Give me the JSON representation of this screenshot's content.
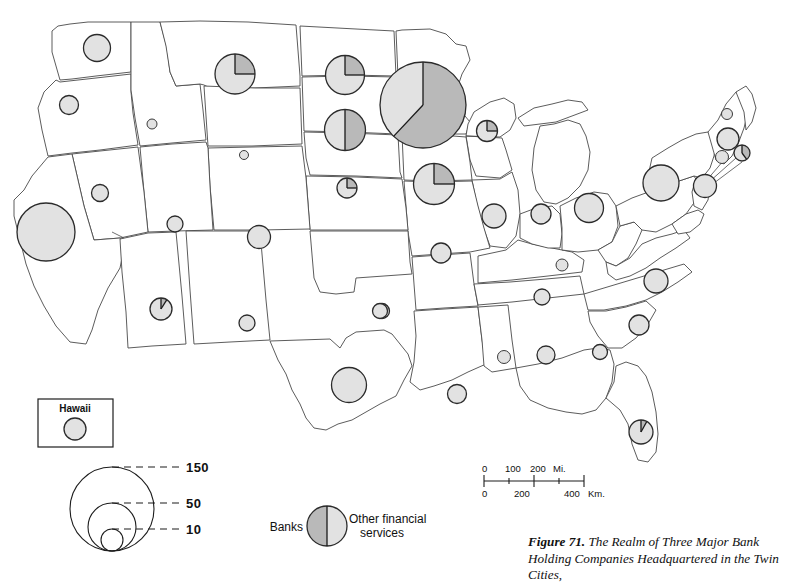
{
  "figure": {
    "number_label": "Figure 71.",
    "caption_text": "The Realm of Three Major Bank Holding Companies Headquartered in the Twin Cities,"
  },
  "inset": {
    "title": "Hawaii",
    "symbol_value": 12
  },
  "size_legend": {
    "label_large": "150",
    "label_medium": "50",
    "label_small": "10",
    "values": [
      150,
      50,
      10
    ]
  },
  "pie_key": {
    "left_label": "Banks",
    "right_label_line1": "Other financial",
    "right_label_line2": "services"
  },
  "scale_bar": {
    "miles_ticks": [
      "0",
      "100",
      "200"
    ],
    "miles_unit": "Mi.",
    "km_ticks": [
      "0",
      "200",
      "400"
    ],
    "km_unit": "Km."
  },
  "colors": {
    "banks_fill": "#b9b9b9",
    "other_fill": "#e2e2e2",
    "outline": "#4a4a4a",
    "symbol_ring": "#2b2b2b",
    "paper": "#ffffff"
  },
  "chart_data": {
    "type": "map",
    "title": "The Realm of Three Major Bank Holding Companies Headquartered in the Twin Cities",
    "symbol_type": "proportional-circle / pie",
    "size_scale_breaks": [
      150,
      50,
      10
    ],
    "categories": [
      "Banks",
      "Other financial services"
    ],
    "symbols": [
      {
        "state": "Washington",
        "x": 97,
        "y": 48,
        "r": 13.5,
        "banks_share": 0.0
      },
      {
        "state": "Oregon",
        "x": 69,
        "y": 105,
        "r": 9.5,
        "banks_share": 0.0
      },
      {
        "state": "Idaho",
        "x": 152,
        "y": 124,
        "r": 5.0,
        "banks_share": 0.0
      },
      {
        "state": "Montana",
        "x": 235,
        "y": 74,
        "r": 20.0,
        "banks_share": 0.25
      },
      {
        "state": "North Dakota",
        "x": 345,
        "y": 75,
        "r": 19.5,
        "banks_share": 0.25
      },
      {
        "state": "South Dakota",
        "x": 345,
        "y": 130,
        "r": 20.5,
        "banks_share": 0.5
      },
      {
        "state": "Minnesota",
        "x": 423,
        "y": 105,
        "r": 43.0,
        "banks_share": 0.62
      },
      {
        "state": "Wisconsin",
        "x": 487,
        "y": 131,
        "r": 10.5,
        "banks_share": 0.25
      },
      {
        "state": "Nebraska",
        "x": 347,
        "y": 188,
        "r": 10.0,
        "banks_share": 0.25
      },
      {
        "state": "Iowa",
        "x": 434,
        "y": 184,
        "r": 20.5,
        "banks_share": 0.25
      },
      {
        "state": "Wyoming",
        "x": 244,
        "y": 155,
        "r": 4.5,
        "banks_share": 0.0
      },
      {
        "state": "Nevada",
        "x": 100,
        "y": 193,
        "r": 8.5,
        "banks_share": 0.0
      },
      {
        "state": "California",
        "x": 46,
        "y": 232,
        "r": 29.0,
        "banks_share": 0.0
      },
      {
        "state": "Utah",
        "x": 175,
        "y": 224,
        "r": 8.0,
        "banks_share": 0.0
      },
      {
        "state": "Colorado",
        "x": 259,
        "y": 237,
        "r": 11.5,
        "banks_share": 0.0
      },
      {
        "state": "Arizona",
        "x": 161,
        "y": 309,
        "r": 11.0,
        "banks_share": 0.09
      },
      {
        "state": "New Mexico",
        "x": 247,
        "y": 323,
        "r": 8.0,
        "banks_share": 0.0
      },
      {
        "state": "Kansas",
        "x": 382,
        "y": 311,
        "r": 7.5,
        "banks_share": 0.0
      },
      {
        "state": "Oklahoma",
        "x": 380,
        "y": 311,
        "r": 7.5,
        "banks_share": 0.0
      },
      {
        "state": "Texas",
        "x": 349,
        "y": 385,
        "r": 17.5,
        "banks_share": 0.0
      },
      {
        "state": "Missouri",
        "x": 441,
        "y": 253,
        "r": 10.0,
        "banks_share": 0.0
      },
      {
        "state": "Illinois",
        "x": 494,
        "y": 216,
        "r": 12.0,
        "banks_share": 0.0
      },
      {
        "state": "Indiana",
        "x": 541,
        "y": 214,
        "r": 10.0,
        "banks_share": 0.0
      },
      {
        "state": "Ohio",
        "x": 589,
        "y": 208,
        "r": 14.5,
        "banks_share": 0.0
      },
      {
        "state": "Kentucky",
        "x": 562,
        "y": 265,
        "r": 6.0,
        "banks_share": 0.0
      },
      {
        "state": "Tennessee",
        "x": 542,
        "y": 297,
        "r": 8.0,
        "banks_share": 0.0
      },
      {
        "state": "North Carolina",
        "x": 656,
        "y": 281,
        "r": 12.0,
        "banks_share": 0.0
      },
      {
        "state": "South Carolina",
        "x": 639,
        "y": 325,
        "r": 10.0,
        "banks_share": 0.0
      },
      {
        "state": "Georgia",
        "x": 600,
        "y": 352,
        "r": 7.5,
        "banks_share": 0.0
      },
      {
        "state": "Alabama",
        "x": 546,
        "y": 355,
        "r": 9.0,
        "banks_share": 0.0
      },
      {
        "state": "Mississippi",
        "x": 504,
        "y": 357,
        "r": 6.5,
        "banks_share": 0.0
      },
      {
        "state": "Louisiana",
        "x": 457,
        "y": 394,
        "r": 9.5,
        "banks_share": 0.0
      },
      {
        "state": "Florida",
        "x": 641,
        "y": 432,
        "r": 12.0,
        "banks_share": 0.08
      },
      {
        "state": "Pennsylvania",
        "x": 661,
        "y": 183,
        "r": 18.0,
        "banks_share": 0.0
      },
      {
        "state": "New York",
        "x": 705,
        "y": 186,
        "r": 11.5,
        "banks_share": 0.0
      },
      {
        "state": "Vermont",
        "x": 727,
        "y": 114,
        "r": 5.5,
        "banks_share": 0.0
      },
      {
        "state": "Massachusetts",
        "x": 728,
        "y": 139,
        "r": 11.0,
        "banks_share": 0.0
      },
      {
        "state": "Connecticut",
        "x": 722,
        "y": 157,
        "r": 6.5,
        "banks_share": 0.0
      },
      {
        "state": "Rhode Island",
        "x": 742,
        "y": 153,
        "r": 8.0,
        "banks_share": 0.4
      }
    ]
  }
}
